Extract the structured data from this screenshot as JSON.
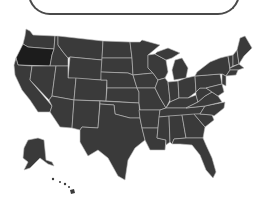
{
  "map": {
    "title": "United States",
    "highlighted_state": "Oregon",
    "colors": {
      "state_fill": "#3a3a3a",
      "highlight_fill": "#1c1c1c",
      "border": "#bdbdbd",
      "background": "#ffffff",
      "box_border": "#4a4a4a"
    }
  }
}
